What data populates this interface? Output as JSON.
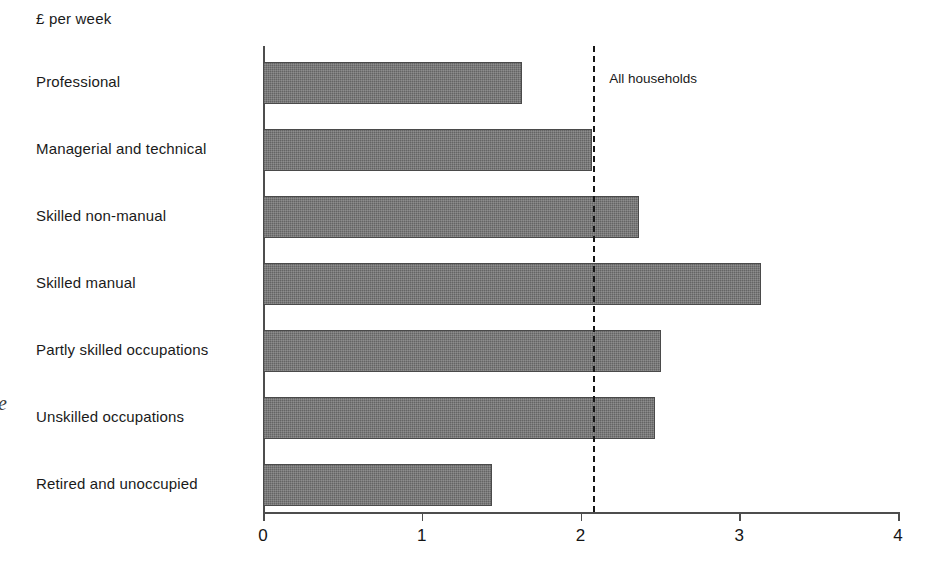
{
  "chart_title": "£ per week",
  "page_artifact": "e",
  "reference": {
    "label": "All households",
    "value": 2.08
  },
  "axis": {
    "ticks": [
      "0",
      "1",
      "2",
      "3",
      "4"
    ]
  },
  "chart_data": {
    "type": "bar",
    "orientation": "horizontal",
    "title": "£ per week",
    "xlabel": "£ per week",
    "ylabel": "",
    "xlim": [
      0,
      4
    ],
    "grid": false,
    "legend": null,
    "categories": [
      "Professional",
      "Managerial and technical",
      "Skilled non-manual",
      "Skilled manual",
      "Partly skilled occupations",
      "Unskilled occupations",
      "Retired and unoccupied"
    ],
    "values": [
      1.63,
      2.07,
      2.37,
      3.14,
      2.51,
      2.47,
      1.44
    ],
    "tick_labels": [
      "0",
      "1",
      "2",
      "3",
      "4"
    ],
    "annotations": [
      {
        "type": "reference-line",
        "label": "All households",
        "value": 2.08,
        "style": "dashed-vertical"
      }
    ],
    "bar_color": "#6f6f6f"
  }
}
